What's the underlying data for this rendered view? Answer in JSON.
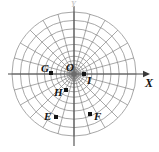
{
  "figure": {
    "background_color": "#ffffff",
    "grid_color": "#8a8a8a",
    "axis_color": "#4a4a4a",
    "label_color": "#141414"
  },
  "axes": {
    "x_label": "X",
    "y_label": "Y",
    "origin_label": "O",
    "x_axis_y_pixel": 74,
    "y_axis_x_pixel": 74,
    "x_axis_start": 8,
    "x_axis_end": 150,
    "y_axis_start": 6,
    "y_axis_end": 146
  },
  "polar_grid": {
    "center_x": 74,
    "center_y": 74,
    "num_spokes": 24,
    "spoke_angle_step_deg": 15,
    "num_rings": 13,
    "max_radius": 62,
    "ring_growth": "geometric",
    "ring_radii": [
      2.0,
      3.2,
      4.8,
      7.0,
      9.8,
      13.4,
      17.8,
      23.2,
      29.6,
      37.0,
      45.2,
      53.6,
      62.0
    ]
  },
  "points": [
    {
      "id": "G",
      "label": "G",
      "x": 51,
      "y": 73,
      "label_dx": -10,
      "label_dy": -1
    },
    {
      "id": "I",
      "label": "I",
      "x": 84,
      "y": 74,
      "label_dx": 3,
      "label_dy": 10
    },
    {
      "id": "H",
      "label": "H",
      "x": 66,
      "y": 90,
      "label_dx": -12,
      "label_dy": 6
    },
    {
      "id": "E",
      "label": "E",
      "x": 56,
      "y": 117,
      "label_dx": -12,
      "label_dy": 3
    },
    {
      "id": "F",
      "label": "F",
      "x": 90,
      "y": 114,
      "label_dx": 4,
      "label_dy": 6
    }
  ]
}
